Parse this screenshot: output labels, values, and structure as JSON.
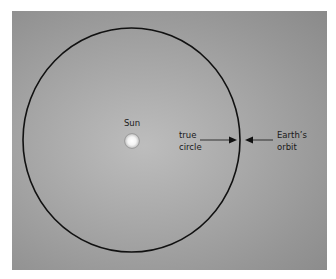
{
  "diagram": {
    "sun": {
      "label": "Sun"
    },
    "annotations": {
      "true_circle": {
        "line1": "true",
        "line2": "circle"
      },
      "earth_orbit": {
        "line1": "Earth’s",
        "line2": "orbit"
      }
    },
    "colors": {
      "orbit_stroke": "#111111",
      "background_center": "#bdbdbd",
      "background_edge": "#8a8a8a",
      "sun_fill": "#ffffff"
    }
  }
}
